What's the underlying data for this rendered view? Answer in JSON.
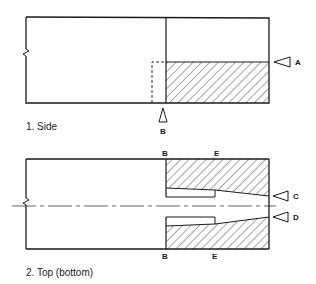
{
  "diagram": {
    "side_view": {
      "caption": "1. Side",
      "markers": [
        {
          "label": "A",
          "direction": "left"
        },
        {
          "label": "B",
          "direction": "up"
        }
      ]
    },
    "top_view": {
      "caption": "2. Top (bottom)",
      "top_labels": [
        "B",
        "E"
      ],
      "bottom_labels": [
        "B",
        "E"
      ],
      "markers": [
        {
          "label": "C",
          "direction": "left"
        },
        {
          "label": "D",
          "direction": "left"
        }
      ]
    }
  },
  "colors": {
    "line": "#1a1a1a",
    "background": "#ffffff"
  }
}
